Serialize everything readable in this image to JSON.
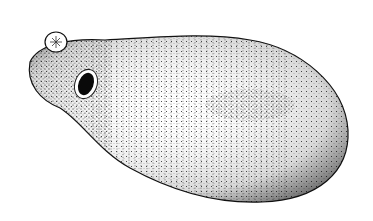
{
  "image": {
    "subject": "stippled drawing of a fluke-like organism",
    "background_color": "#ffffff",
    "ink_color": "#111111",
    "parts": [
      {
        "name": "body",
        "description": "large pear-shaped stippled body with transverse ridges"
      },
      {
        "name": "oral-sucker",
        "description": "small round star-marked sucker at anterior tip"
      },
      {
        "name": "ventral-sucker",
        "description": "dark oval opening near anterior end"
      },
      {
        "name": "dark-band",
        "description": "darker stippled area in the middle of the body"
      }
    ]
  }
}
